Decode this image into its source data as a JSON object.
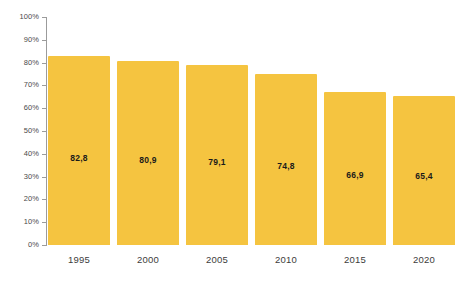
{
  "chart_data": {
    "type": "bar",
    "title": "",
    "subtitle": "",
    "xlabel": "",
    "ylabel": "",
    "categories": [
      "1995",
      "2000",
      "2005",
      "2010",
      "2015",
      "2020"
    ],
    "values": [
      82.8,
      80.9,
      79.1,
      74.8,
      66.9,
      65.4
    ],
    "value_labels": [
      "82,8",
      "80,9",
      "79,1",
      "74,8",
      "66,9",
      "65,4"
    ],
    "ylim": [
      0,
      100
    ],
    "y_ticks": [
      0,
      10,
      20,
      30,
      40,
      50,
      60,
      70,
      80,
      90,
      100
    ],
    "y_tick_labels": [
      "0%",
      "10%",
      "20%",
      "30%",
      "40%",
      "50%",
      "60%",
      "70%",
      "80%",
      "90%",
      "100%"
    ],
    "grid": false,
    "legend": false,
    "legend_position": "none",
    "series": [
      {
        "name": "",
        "values": [
          82.8,
          80.9,
          79.1,
          74.8,
          66.9,
          65.4
        ]
      }
    ],
    "annotations": [],
    "colors": {
      "bar": "#f5c440",
      "background": "#ffffff",
      "axis": "#9b9b9b",
      "tick_label": "#4a4a4a",
      "category_label": "#3c3c3c",
      "value_label": "#1a1a1a"
    }
  }
}
